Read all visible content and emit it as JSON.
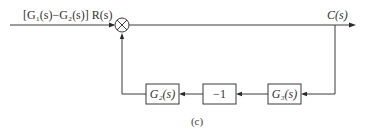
{
  "diagram": {
    "type": "block-diagram",
    "input_label": "[G₁(s)−G₂(s)] R(s)",
    "output_label": "C(s)",
    "summing_junction": {
      "symbol": "cross-circle"
    },
    "blocks": [
      {
        "id": "G3",
        "label": "G₃(s)"
      },
      {
        "id": "neg1",
        "label": "−1"
      },
      {
        "id": "G2",
        "label": "G₂(s)"
      }
    ],
    "caption": "(c)",
    "signal_flow": [
      "input -> summing-junction",
      "summing-junction -> output C(s)",
      "output pickoff -> G3(s)",
      "G3(s) -> -1",
      "-1 -> G2(s)",
      "G2(s) -> summing-junction"
    ]
  }
}
